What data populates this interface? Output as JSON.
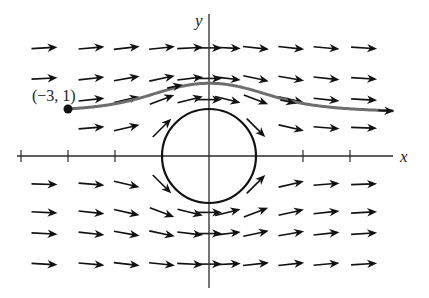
{
  "figure": {
    "type": "vector-field",
    "axes": {
      "x_label": "x",
      "y_label": "y",
      "x_ticks": [
        -4,
        -3,
        -2,
        2,
        3
      ],
      "origin_px": [
        209,
        156
      ],
      "unit_px": 47
    },
    "obstacle": {
      "shape": "circle",
      "center": [
        0,
        0
      ],
      "radius": 1
    },
    "point": {
      "label": "(−3, 1)",
      "coords": [
        -3,
        1
      ]
    },
    "streamline": {
      "start": [
        -3,
        1
      ],
      "color": "#6e6e6e"
    },
    "field": {
      "formula": "F = (1 - (x^2 - y^2)/(x^2 + y^2)^2, -2xy/(x^2 + y^2)^2)",
      "grid_x": [
        -3.5,
        -2.5,
        -1.75,
        -1.0,
        -0.4,
        0.0,
        0.4,
        1.0,
        1.75,
        2.5,
        3.3
      ],
      "grid_y": [
        2.3,
        1.65,
        1.2,
        0.6,
        -0.6,
        -1.2,
        -1.65,
        -2.3
      ],
      "arrow_color": "#111111"
    },
    "colors": {
      "background": "#ffffff",
      "axes": "#2a2a2a",
      "circle": "#111111",
      "streamline": "#6e6e6e"
    }
  }
}
